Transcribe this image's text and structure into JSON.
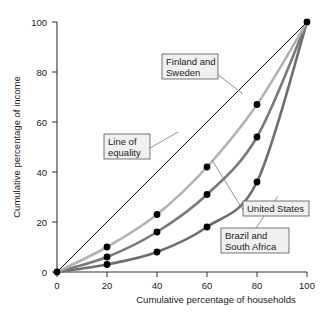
{
  "chart_data": {
    "type": "line",
    "title": "",
    "xlabel": "Cumulative percentage of households",
    "ylabel": "Cumulative percentage of income",
    "xlim": [
      0,
      100
    ],
    "ylim": [
      0,
      100
    ],
    "xticks": [
      "0",
      "20",
      "40",
      "60",
      "80",
      "100"
    ],
    "yticks": [
      "0",
      "20",
      "40",
      "60",
      "80",
      "100"
    ],
    "xtick_values": [
      0,
      20,
      40,
      60,
      80,
      100
    ],
    "ytick_values": [
      0,
      20,
      40,
      60,
      80,
      100
    ],
    "grid": false,
    "legend_position": "annotations",
    "series": [
      {
        "name": "Line of equality",
        "color": "#111111",
        "width": 1.0,
        "markers": false,
        "x": [
          0,
          100
        ],
        "values": [
          0,
          100
        ]
      },
      {
        "name": "Finland and Sweden",
        "color": "#b3b3b3",
        "width": 2.6,
        "markers": true,
        "x": [
          0,
          20,
          40,
          60,
          80,
          100
        ],
        "values": [
          0,
          10,
          23,
          42,
          67,
          100
        ]
      },
      {
        "name": "United States",
        "color": "#7a7a7a",
        "width": 2.6,
        "markers": true,
        "x": [
          0,
          20,
          40,
          60,
          80,
          100
        ],
        "values": [
          0,
          6,
          16,
          31,
          54,
          100
        ]
      },
      {
        "name": "Brazil and South Africa",
        "color": "#6e6e6e",
        "width": 2.6,
        "markers": true,
        "x": [
          0,
          20,
          40,
          60,
          80,
          100
        ],
        "values": [
          0,
          3,
          8,
          18,
          36,
          100
        ]
      }
    ],
    "annotations": [
      {
        "id": "finland-sweden",
        "text_line1": "Finland and",
        "text_line2": "Sweden"
      },
      {
        "id": "line-of-equality",
        "text_line1": "Line of",
        "text_line2": "equality"
      },
      {
        "id": "united-states",
        "text_line1": "United States",
        "text_line2": ""
      },
      {
        "id": "brazil-south-africa",
        "text_line1": "Brazil and",
        "text_line2": "South Africa"
      }
    ]
  },
  "axes": {
    "x_title": "Cumulative percentage of households",
    "y_title": "Cumulative percentage of income",
    "x_tick_0": "0",
    "x_tick_1": "20",
    "x_tick_2": "40",
    "x_tick_3": "60",
    "x_tick_4": "80",
    "x_tick_5": "100",
    "y_tick_0": "0",
    "y_tick_1": "20",
    "y_tick_2": "40",
    "y_tick_3": "60",
    "y_tick_4": "80",
    "y_tick_5": "100"
  },
  "callouts": {
    "finland_l1": "Finland and",
    "finland_l2": "Sweden",
    "equality_l1": "Line of",
    "equality_l2": "equality",
    "us_l1": "United States",
    "brazil_l1": "Brazil and",
    "brazil_l2": "South Africa"
  },
  "colors": {
    "equality_line": "#111111",
    "finland_sweden": "#b3b3b3",
    "united_states": "#7a7a7a",
    "brazil_south_africa": "#6e6e6e",
    "marker": "#000000",
    "callout_fill": "#f0f0f0",
    "callout_stroke": "#555555",
    "axis": "#333333"
  }
}
